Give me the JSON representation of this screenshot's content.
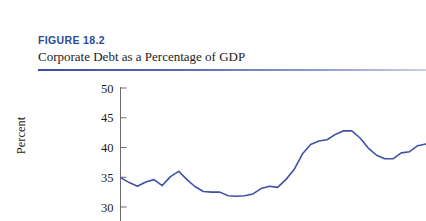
{
  "figure": {
    "number_label": "FIGURE 18.2",
    "title": "Corporate Debt as a Percentage of GDP",
    "number_color": "#2b4a9b",
    "rule_color": "#3b4fa0"
  },
  "chart_data": {
    "type": "line",
    "title": "Corporate Debt as a Percentage of GDP",
    "xlabel": "",
    "ylabel": "Percent",
    "ylim": [
      28,
      50
    ],
    "yticks": [
      30,
      35,
      40,
      45,
      50
    ],
    "ytick_labels": [
      "30",
      "35",
      "40",
      "45",
      "50"
    ],
    "grid": false,
    "legend": "none",
    "line_color": "#3f51a8",
    "axis_color": "#6b6b6b",
    "x_axis_visible": false,
    "note": "Bottom of figure is cropped; x-axis line and tick labels are not visible in the screenshot.",
    "series": [
      {
        "name": "Corporate Debt as a Percentage of GDP",
        "values": [
          34.9,
          34.1,
          33.5,
          34.2,
          34.6,
          33.6,
          35.1,
          36.0,
          34.6,
          33.4,
          32.6,
          32.5,
          32.5,
          31.9,
          31.8,
          31.9,
          32.2,
          33.1,
          33.5,
          33.3,
          34.6,
          36.3,
          38.9,
          40.5,
          41.1,
          41.3,
          42.2,
          42.8,
          42.8,
          41.6,
          39.9,
          38.7,
          38.1,
          38.1,
          39.1,
          39.3,
          40.3,
          40.6
        ]
      }
    ],
    "y_min_observed": 31.8,
    "y_max_observed": 42.8,
    "first_value": 34.9,
    "last_value": 40.6,
    "point_count": 38
  }
}
